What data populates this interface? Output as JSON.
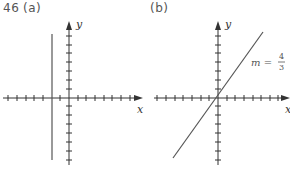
{
  "problem_number": "46",
  "panels": [
    {
      "label": "(a)",
      "x_axis_label": "x",
      "y_axis_label": "y",
      "line": {
        "type": "vertical",
        "x_ticks_from_origin": -2
      }
    },
    {
      "label": "(b)",
      "x_axis_label": "x",
      "y_axis_label": "y",
      "line": {
        "type": "slope",
        "through_origin": true
      },
      "annotation": {
        "prefix": "m =",
        "numerator": "4",
        "denominator": "3"
      }
    }
  ],
  "colors": {
    "axis": "#333333",
    "line": "#555555",
    "text": "#555555"
  }
}
